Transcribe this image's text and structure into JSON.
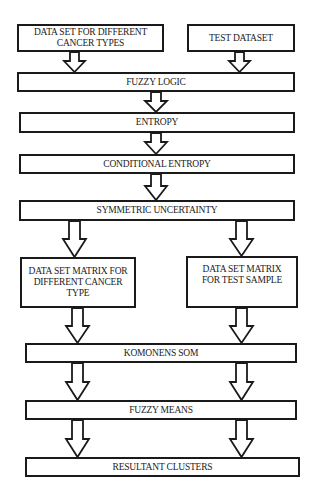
{
  "diagram": {
    "type": "flowchart",
    "direction": "top-to-bottom",
    "colors": {
      "stroke": "#1a1a1a",
      "fill": "#ffffff",
      "text": "#222222"
    },
    "nodes": {
      "cancer_dataset": "DATA SET FOR DIFFERENT CANCER TYPES",
      "test_dataset": "TEST DATASET",
      "fuzzy_logic": "FUZZY LOGIC",
      "entropy": "ENTROPY",
      "conditional_entropy": "CONDITIONAL ENTROPY",
      "symmetric_uncertainty": "SYMMETRIC UNCERTAINTY",
      "matrix_cancer": "DATA SET MATRIX FOR DIFFERENT CANCER TYPE",
      "matrix_test": "DATA SET MATRIX FOR TEST SAMPLE",
      "komonens_som": "KOMONENS SOM",
      "fuzzy_means": "FUZZY MEANS",
      "resultant_clusters": "RESULTANT CLUSTERS"
    },
    "node_lines": {
      "cancer_dataset": [
        "DATA SET FOR DIFFERENT",
        "CANCER TYPES"
      ],
      "matrix_cancer": [
        "DATA SET MATRIX FOR",
        "DIFFERENT CANCER",
        "TYPE"
      ],
      "matrix_test": [
        "DATA SET MATRIX",
        "FOR TEST SAMPLE"
      ]
    },
    "edges": [
      {
        "from": "cancer_dataset",
        "to": "fuzzy_logic"
      },
      {
        "from": "test_dataset",
        "to": "fuzzy_logic"
      },
      {
        "from": "fuzzy_logic",
        "to": "entropy"
      },
      {
        "from": "entropy",
        "to": "conditional_entropy"
      },
      {
        "from": "conditional_entropy",
        "to": "symmetric_uncertainty"
      },
      {
        "from": "symmetric_uncertainty",
        "to": "matrix_cancer"
      },
      {
        "from": "symmetric_uncertainty",
        "to": "matrix_test"
      },
      {
        "from": "matrix_cancer",
        "to": "komonens_som"
      },
      {
        "from": "matrix_test",
        "to": "komonens_som"
      },
      {
        "from": "komonens_som",
        "to": "fuzzy_means"
      },
      {
        "from": "komonens_som",
        "to": "fuzzy_means"
      },
      {
        "from": "fuzzy_means",
        "to": "resultant_clusters"
      },
      {
        "from": "fuzzy_means",
        "to": "resultant_clusters"
      }
    ],
    "arrow_style": "hollow block arrow"
  }
}
